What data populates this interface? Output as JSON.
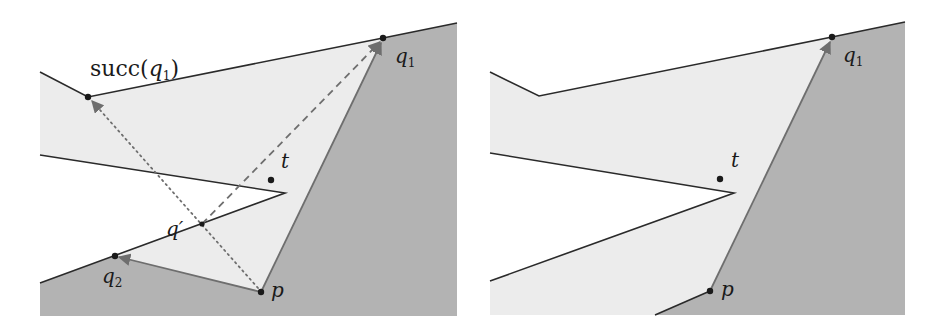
{
  "colors": {
    "background": "#ffffff",
    "light_region": "#ececec",
    "dark_region": "#b3b3b3",
    "edge": "#2a2a2a",
    "arrow": "#6e6e6e",
    "point": "#1a1a1a"
  },
  "left_panel": {
    "labels": {
      "succ_q1": "succ(",
      "succ_q1_var": "q",
      "succ_q1_sub": "1",
      "succ_q1_close": ")",
      "q1_var": "q",
      "q1_sub": "1",
      "q2_var": "q",
      "q2_sub": "2",
      "p": "p",
      "t": "t",
      "q_prime": "q′"
    },
    "points": {
      "q1": [
        383,
        38
      ],
      "succ_q1": [
        88,
        97
      ],
      "q2": [
        115,
        256
      ],
      "p": [
        261,
        292
      ],
      "t": [
        271,
        180
      ],
      "q_prime": [
        202,
        224
      ]
    },
    "edges": {
      "solid_arrows": [
        "p → q1",
        "p → q2"
      ],
      "dashed_arrow": "q' → q1",
      "dotted_arrow": "p → succ(q1)"
    }
  },
  "right_panel": {
    "labels": {
      "q1_var": "q",
      "q1_sub": "1",
      "p": "p",
      "t": "t"
    },
    "points": {
      "q1": [
        832,
        37
      ],
      "p": [
        710,
        291
      ],
      "t": [
        720,
        179
      ]
    },
    "edges": {
      "solid_arrows": [
        "p → q1"
      ]
    }
  }
}
